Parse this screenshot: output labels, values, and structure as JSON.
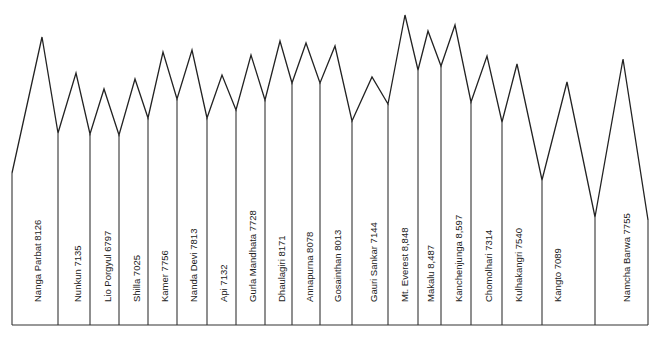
{
  "diagram": {
    "type": "mountain-profile",
    "colors": {
      "line": "#222222",
      "background": "#ffffff"
    },
    "baseline_y": 325,
    "start_point": {
      "x": 12,
      "y": 173
    },
    "end_point": {
      "x": 648,
      "y": 220
    },
    "peaks": [
      {
        "name": "Nanga Parbat",
        "height": "8126",
        "label": "Nanga Parbat 8126",
        "peak": [
          42,
          37
        ],
        "valley": [
          58,
          133
        ],
        "label_x": 37,
        "label_y": 300
      },
      {
        "name": "Nunkun",
        "height": "7135",
        "label": "Nunkun 7135",
        "peak": [
          76,
          73
        ],
        "valley": [
          90,
          134
        ],
        "label_x": 77,
        "label_y": 300
      },
      {
        "name": "Lio Porgyul",
        "height": "6797",
        "label": "Lio Porgyul 6797",
        "peak": [
          104,
          89
        ],
        "valley": [
          119,
          135
        ],
        "label_x": 107,
        "label_y": 300
      },
      {
        "name": "Shilla",
        "height": "7025",
        "label": "Shilla 7025",
        "peak": [
          135,
          79
        ],
        "valley": [
          148,
          118
        ],
        "label_x": 136,
        "label_y": 300
      },
      {
        "name": "Kamer",
        "height": "7756",
        "label": "Kamer 7756",
        "peak": [
          163,
          52
        ],
        "valley": [
          177,
          99
        ],
        "label_x": 164,
        "label_y": 300
      },
      {
        "name": "Nanda Devi",
        "height": "7813",
        "label": "Nanda Devi 7813",
        "peak": [
          192,
          50
        ],
        "valley": [
          207,
          118
        ],
        "label_x": 193,
        "label_y": 300
      },
      {
        "name": "Api",
        "height": "7132",
        "label": "Api 7132",
        "peak": [
          222,
          75
        ],
        "valley": [
          236,
          110
        ],
        "label_x": 223,
        "label_y": 300
      },
      {
        "name": "Gurla Mandhata",
        "height": "7728",
        "label": "Gurla Mandhata 7728",
        "peak": [
          251,
          55
        ],
        "valley": [
          265,
          100
        ],
        "label_x": 252,
        "label_y": 300
      },
      {
        "name": "Dhaulagiri",
        "height": "8171",
        "label": "Dhaulagiri 8171",
        "peak": [
          280,
          41
        ],
        "valley": [
          292,
          83
        ],
        "label_x": 281,
        "label_y": 300
      },
      {
        "name": "Annapurna",
        "height": "8078",
        "label": "Annapurna 8078",
        "peak": [
          306,
          43
        ],
        "valley": [
          320,
          83
        ],
        "label_x": 309,
        "label_y": 300
      },
      {
        "name": "Gosainthan",
        "height": "8013",
        "label": "Gosainthan 8013",
        "peak": [
          335,
          46
        ],
        "valley": [
          352,
          121
        ],
        "label_x": 337,
        "label_y": 300
      },
      {
        "name": "Gauri Sankar",
        "height": "7144",
        "label": "Gauri Sankar 7144",
        "peak": [
          372,
          77
        ],
        "valley": [
          388,
          104
        ],
        "label_x": 373,
        "label_y": 300
      },
      {
        "name": "Mt. Everest",
        "height": "8,848",
        "label": "Mt. Everest 8,848",
        "peak": [
          405,
          15
        ],
        "valley": [
          418,
          70
        ],
        "label_x": 404,
        "label_y": 300
      },
      {
        "name": "Makalu",
        "height": "8,487",
        "label": "Makalu 8,487",
        "peak": [
          428,
          31
        ],
        "valley": [
          441,
          66
        ],
        "label_x": 430,
        "label_y": 300
      },
      {
        "name": "Kanchenjunga",
        "height": "8,597",
        "label": "Kanchenjunga 8,597",
        "peak": [
          455,
          25
        ],
        "valley": [
          471,
          102
        ],
        "label_x": 458,
        "label_y": 300
      },
      {
        "name": "Chomolhari",
        "height": "7314",
        "label": "Chomolhari 7314",
        "peak": [
          487,
          56
        ],
        "valley": [
          502,
          122
        ],
        "label_x": 488,
        "label_y": 300
      },
      {
        "name": "Kulhakangri",
        "height": "7540",
        "label": "Kulhakangri 7540",
        "peak": [
          517,
          64
        ],
        "valley": [
          542,
          180
        ],
        "label_x": 518,
        "label_y": 300
      },
      {
        "name": "Kangto",
        "height": "7089",
        "label": "Kangto 7089",
        "peak": [
          567,
          82
        ],
        "valley": [
          595,
          217
        ],
        "label_x": 557,
        "label_y": 300
      },
      {
        "name": "Namcha Barwa",
        "height": "7755",
        "label": "Namcha Barwa 7755",
        "peak": [
          623,
          59
        ],
        "valley": null,
        "label_x": 626,
        "label_y": 300
      }
    ]
  }
}
